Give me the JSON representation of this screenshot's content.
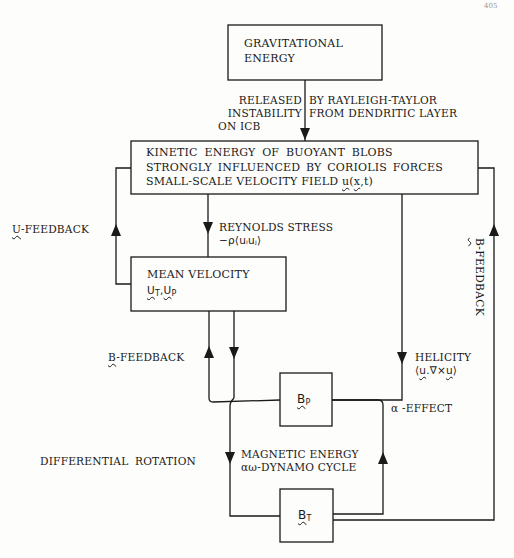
{
  "page_number": "405",
  "boxes": {
    "gravitational": {
      "line1": "GRAVITATIONAL",
      "line2": "ENERGY"
    },
    "kinetic": {
      "line1": "KINETIC ENERGY OF BUOYANT BLOBS",
      "line2": "STRONGLY INFLUENCED BY CORIOLIS FORCES",
      "line3_prefix": "SMALL-SCALE VELOCITY FIELD ",
      "line3_u": "u",
      "line3_open": "(",
      "line3_x": "x",
      "line3_rest": ",t)"
    },
    "mean_velocity": {
      "line1": "MEAN VELOCITY",
      "u1": "U",
      "sub1": "T",
      "sep": ",",
      "u2": "U",
      "sub2": "P"
    },
    "bp": {
      "symbol": "B",
      "sub": "P"
    },
    "bt": {
      "symbol": "B",
      "sub": "T"
    }
  },
  "labels": {
    "released_left": [
      "RELEASED",
      "INSTABILITY",
      "ON ICB"
    ],
    "released_right": [
      "BY RAYLEIGH-TAYLOR",
      "FROM DENDRITIC LAYER"
    ],
    "u_feedback": {
      "symbol": "U",
      "text": "-FEEDBACK"
    },
    "reynolds": {
      "line1": "REYNOLDS STRESS",
      "line2": "−ρ⟨uᵢuⱼ⟩"
    },
    "b_feedback_left": {
      "symbol": "B",
      "text": "-FEEDBACK"
    },
    "b_feedback_right": {
      "symbol": "B",
      "text": "-FEEDBACK"
    },
    "helicity": {
      "line1": "HELICITY",
      "line2_open": "⟨",
      "u1": "u",
      "mid": ".∇×",
      "u2": "u",
      "close": "⟩"
    },
    "alpha_effect": "α -EFFECT",
    "differential_rotation": "DIFFERENTIAL ROTATION",
    "magnetic": {
      "line1": "MAGNETIC ENERGY",
      "line2": "αω-DYNAMO CYCLE"
    }
  },
  "colors": {
    "ink": "#1a1a1a",
    "paper": "#fdfdfc"
  }
}
